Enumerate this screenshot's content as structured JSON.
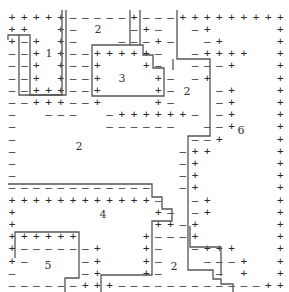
{
  "diagram": {
    "title": "",
    "grid": {
      "cols": 23,
      "x0": 12,
      "dx": 12.2,
      "y0": 17,
      "dy": 12.2,
      "rows": [
        "+++++-----+---+++++++++",
        "++  +-    -+-  -+     +",
        "+-+ +-   ---+-  -+    +",
        "--+ +--+++++-  -++++  +",
        "--+ +--+   +-  ---+   +",
        "--+ +--+    +- -+     +",
        "--+++--+    +-   -+   +",
        "--+++--+    +-   -+   +",
        "-  ---  -++++++- -+   +",
        "-       ------  --+   +",
        "-              --+    +",
        "-             -++     +",
        "-             -+      +",
        "-             -+      +",
        "------------  -+      +",
        "++++++++++++-  -+     +",
        "+           +- -+     +",
        "+           ++-+      +",
        "++++++     +---+      +",
        "+------+   +-  -+++   +",
        "+-    -+   +-   ---+  +",
        "-     -+   +-    - +  +",
        "------+++------------++++"
      ]
    },
    "region_labels": [
      {
        "text": "1",
        "x": 49,
        "y": 53
      },
      {
        "text": "2",
        "x": 98,
        "y": 29
      },
      {
        "text": "3",
        "x": 122,
        "y": 78
      },
      {
        "text": "2",
        "x": 187,
        "y": 91
      },
      {
        "text": "6",
        "x": 241,
        "y": 130
      },
      {
        "text": "2",
        "x": 79,
        "y": 146
      },
      {
        "text": "4",
        "x": 103,
        "y": 214
      },
      {
        "text": "5",
        "x": 48,
        "y": 265
      },
      {
        "text": "2",
        "x": 174,
        "y": 266
      }
    ],
    "colors": {
      "background": "#ffffff",
      "symbols": "#2a2a2a",
      "boundary": "#555555"
    }
  }
}
